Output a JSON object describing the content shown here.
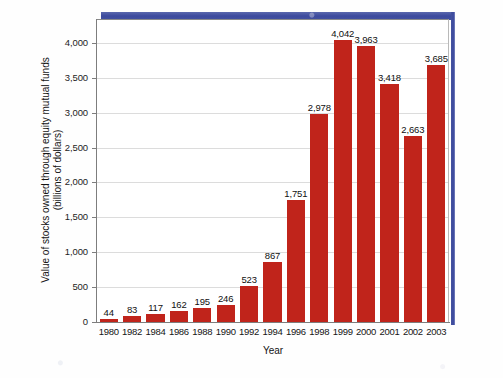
{
  "chart_data": {
    "type": "bar",
    "title": "",
    "xlabel": "Year",
    "ylabel": "Value of stocks owned through equity mutual funds (billions of dollars)",
    "ylabel_line1": "Value of stocks owned through equity mutual funds",
    "ylabel_line2": "(billions of dollars)",
    "categories": [
      "1980",
      "1982",
      "1984",
      "1986",
      "1988",
      "1990",
      "1992",
      "1994",
      "1996",
      "1998",
      "1999",
      "2000",
      "2001",
      "2002",
      "2003"
    ],
    "values": [
      44,
      83,
      117,
      162,
      195,
      246,
      523,
      867,
      1751,
      2978,
      4042,
      3963,
      3418,
      2663,
      3685
    ],
    "value_labels": [
      "44",
      "83",
      "117",
      "162",
      "195",
      "246",
      "523",
      "867",
      "1,751",
      "2,978",
      "4,042",
      "3,963",
      "3,418",
      "2,663",
      "3,685"
    ],
    "ylim": [
      0,
      4300
    ],
    "yticks": [
      0,
      500,
      1000,
      1500,
      2000,
      2500,
      3000,
      3500,
      4000
    ],
    "ytick_labels": [
      "0",
      "500",
      "1,000",
      "1,500",
      "2,000",
      "2,500",
      "3,000",
      "3,500",
      "4,000"
    ],
    "grid": true,
    "legend": "none",
    "bar_color": "#c0241b",
    "frame_accent_color": "#3c4a9e",
    "gridline_color": "#dcdcdc",
    "axis_color": "#7d7d7d",
    "background_color": "#ffffff"
  }
}
